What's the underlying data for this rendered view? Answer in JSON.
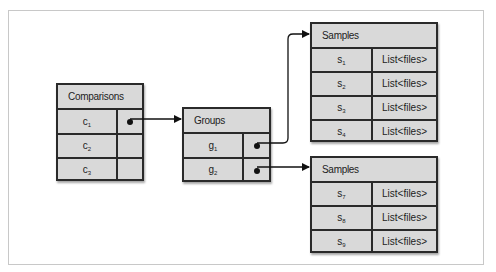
{
  "diagram": {
    "comparisons": {
      "title": "Comparisons",
      "rows": [
        {
          "base": "c",
          "sub": "1",
          "has_pointer": true
        },
        {
          "base": "c",
          "sub": "2",
          "has_pointer": false
        },
        {
          "base": "c",
          "sub": "3",
          "has_pointer": false
        }
      ]
    },
    "groups": {
      "title": "Groups",
      "rows": [
        {
          "base": "g",
          "sub": "1",
          "has_pointer": true
        },
        {
          "base": "g",
          "sub": "2",
          "has_pointer": true
        }
      ]
    },
    "samples_top": {
      "title": "Samples",
      "rows": [
        {
          "base": "s",
          "sub": "1",
          "value": "List<files>"
        },
        {
          "base": "s",
          "sub": "2",
          "value": "List<files>"
        },
        {
          "base": "s",
          "sub": "3",
          "value": "List<files>"
        },
        {
          "base": "s",
          "sub": "4",
          "value": "List<files>"
        }
      ]
    },
    "samples_bottom": {
      "title": "Samples",
      "rows": [
        {
          "base": "s",
          "sub": "7",
          "value": "List<files>"
        },
        {
          "base": "s",
          "sub": "8",
          "value": "List<files>"
        },
        {
          "base": "s",
          "sub": "9",
          "value": "List<files>"
        }
      ]
    },
    "edges": [
      {
        "from": "comparisons.c1",
        "to": "groups"
      },
      {
        "from": "groups.g1",
        "to": "samples_top"
      },
      {
        "from": "groups.g2",
        "to": "samples_bottom"
      }
    ],
    "colors": {
      "cell_fill": "#d9d9d9",
      "border": "#2a2a2a",
      "frame": "#c8c8c8"
    }
  }
}
